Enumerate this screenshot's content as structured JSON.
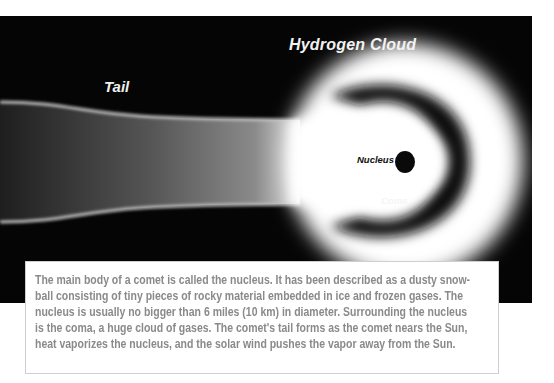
{
  "diagram": {
    "labels": {
      "hydrogen_cloud": "Hydrogen Cloud",
      "tail": "Tail",
      "nucleus": "Nucleus",
      "coma": "Coma"
    },
    "colors": {
      "background": "#050505",
      "glow": "#ffffff",
      "nucleus": "#0a0a0a",
      "caption_text": "#8a8a8a"
    }
  },
  "caption": {
    "lines": [
      "The main body of a comet is called the nucleus. It has been described as a dusty snow-",
      "ball consisting of tiny pieces of rocky material embedded in ice and frozen gases. The",
      "nucleus is usually no bigger than 6 miles (10 km) in diameter. Surrounding the nucleus",
      "is the coma, a huge cloud of gases. The comet's tail forms as the comet nears the Sun,",
      "heat vaporizes the nucleus, and the solar wind pushes the vapor away from the Sun."
    ]
  }
}
